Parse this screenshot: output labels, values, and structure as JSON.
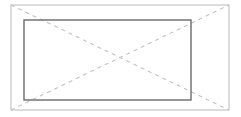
{
  "document": {
    "title": "Window Elevation Symbol",
    "background_color": "#ffffff",
    "width": 241,
    "height": 117
  },
  "drawing": {
    "type": "architectural-window-elevation",
    "outer_frame": {
      "name": "outer-frame-rectangle",
      "x": 11,
      "y": 5,
      "width": 218,
      "height": 105,
      "stroke_color": "#b9b9b9",
      "stroke_width": 1,
      "fill": "none"
    },
    "inner_panel": {
      "name": "inner-panel-rectangle",
      "x": 24,
      "y": 20,
      "width": 167,
      "height": 80,
      "stroke_color": "#6b6b6b",
      "stroke_width": 1.4,
      "fill": "none"
    },
    "crossing_point": {
      "x": 62,
      "y": 70
    },
    "dashed_lines": [
      {
        "name": "diagonal-top-left-to-bottom-right",
        "x1": 11,
        "y1": 5,
        "x2": 229,
        "y2": 110,
        "stroke_color": "#c2c2c2",
        "stroke_width": 1.1,
        "dash_pattern": "4 4"
      },
      {
        "name": "diagonal-bottom-left-to-top-right",
        "x1": 11,
        "y1": 110,
        "x2": 229,
        "y2": 5,
        "stroke_color": "#c2c2c2",
        "stroke_width": 1.1,
        "dash_pattern": "4 4"
      }
    ],
    "colors": {
      "outer_stroke": "#b9b9b9",
      "inner_stroke": "#6b6b6b",
      "dash_stroke": "#c2c2c2",
      "background": "#ffffff"
    }
  }
}
